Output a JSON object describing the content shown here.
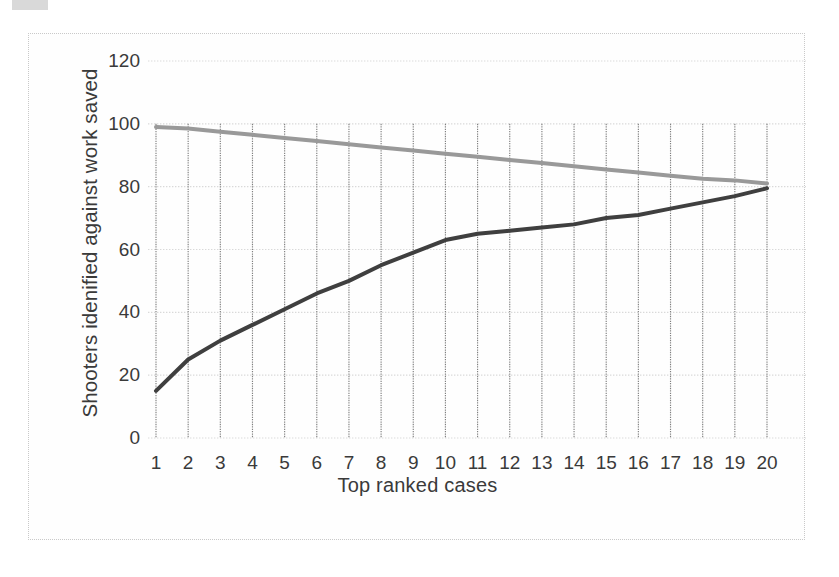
{
  "figure": {
    "frame_border_color": "#c9c9c9",
    "background": "#ffffff"
  },
  "chart_data": {
    "type": "line",
    "title": "",
    "subtitle": "",
    "xlabel": "Top ranked cases",
    "ylabel": "Shooters idenified against work saved",
    "categories": [
      "1",
      "2",
      "3",
      "4",
      "5",
      "6",
      "7",
      "8",
      "9",
      "10",
      "11",
      "12",
      "13",
      "14",
      "15",
      "16",
      "17",
      "18",
      "19",
      "20"
    ],
    "x": [
      1,
      2,
      3,
      4,
      5,
      6,
      7,
      8,
      9,
      10,
      11,
      12,
      13,
      14,
      15,
      16,
      17,
      18,
      19,
      20
    ],
    "ylim": [
      0,
      120
    ],
    "yticks": [
      "0",
      "20",
      "40",
      "60",
      "80",
      "100",
      "120"
    ],
    "ytick_values": [
      0,
      20,
      40,
      60,
      80,
      100,
      120
    ],
    "xlim": [
      1,
      20
    ],
    "grid": "both",
    "grid_color_horizontal": "#d9d9d9",
    "grid_color_vertical": "#808080",
    "legend": "none",
    "legend_position": "none",
    "series": [
      {
        "name": "Work saved",
        "color": "#999999",
        "line_width": 4,
        "values": [
          99,
          98.5,
          97.5,
          96.5,
          95.5,
          94.5,
          93.5,
          92.5,
          91.5,
          90.5,
          89.5,
          88.5,
          87.5,
          86.5,
          85.5,
          84.5,
          83.5,
          82.5,
          82,
          81
        ]
      },
      {
        "name": "Shooters identified",
        "color": "#3f3f3f",
        "line_width": 4,
        "values": [
          15,
          25,
          31,
          36,
          41,
          46,
          50,
          55,
          59,
          63,
          65,
          66,
          67,
          68,
          70,
          71,
          73,
          75,
          77,
          79.5
        ]
      }
    ]
  }
}
